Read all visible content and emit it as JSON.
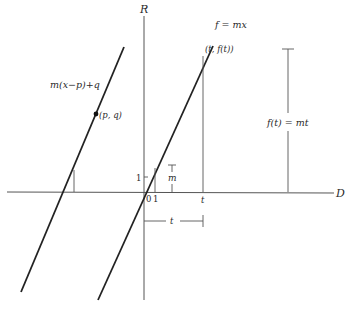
{
  "axes": {
    "vertical_label": "R",
    "horizontal_label": "D",
    "origin_label": "0",
    "unit_x_label": "1",
    "unit_y_label": "1"
  },
  "lines": {
    "main": {
      "label": "f = mx"
    },
    "shifted": {
      "label": "m(x−p)+q"
    }
  },
  "points": {
    "pq": {
      "label": "(p, q)"
    },
    "tft": {
      "label": "(t, f(t))"
    }
  },
  "markers": {
    "slope": "m",
    "t_tick": "t",
    "height": "f(t) = mt",
    "t_bracket": "t"
  },
  "colors": {
    "ink": "#222222",
    "thin": "#555555",
    "background": "#ffffff"
  }
}
